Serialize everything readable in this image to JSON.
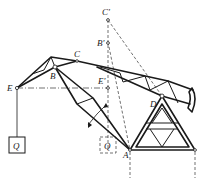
{
  "figure": {
    "labels": {
      "C_prime": "C'",
      "B_prime": "B'",
      "C": "C",
      "B": "B",
      "E": "E",
      "E_prime": "E'",
      "D": "D",
      "A": "A",
      "Q_load": "Q",
      "Q_ghost": "Q"
    },
    "colors": {
      "line": "#1a1a1a",
      "background": "#ffffff"
    }
  }
}
